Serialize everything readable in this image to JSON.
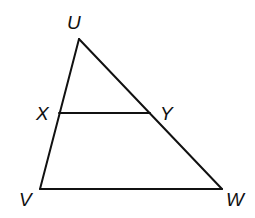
{
  "diagram": {
    "type": "triangle-with-parallel-segment",
    "vertices": {
      "U": {
        "label": "U",
        "x": 79,
        "y": 39
      },
      "V": {
        "label": "V",
        "x": 40,
        "y": 189
      },
      "W": {
        "label": "W",
        "x": 222,
        "y": 189
      },
      "X": {
        "label": "X",
        "x": 59,
        "y": 113
      },
      "Y": {
        "label": "Y",
        "x": 150,
        "y": 113
      }
    },
    "segments": [
      {
        "name": "UV",
        "from": "U",
        "to": "V"
      },
      {
        "name": "UW",
        "from": "U",
        "to": "W"
      },
      {
        "name": "VW",
        "from": "V",
        "to": "W"
      },
      {
        "name": "XY",
        "from": "X",
        "to": "Y"
      }
    ],
    "labels": {
      "U": "U",
      "V": "V",
      "W": "W",
      "X": "X",
      "Y": "Y"
    },
    "colors": {
      "stroke": "#111111",
      "background": "#ffffff"
    }
  }
}
